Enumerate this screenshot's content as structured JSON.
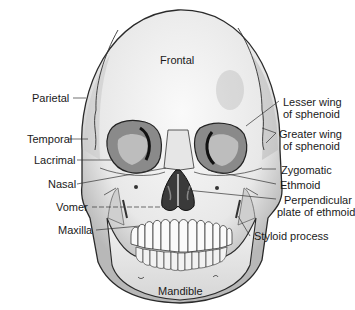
{
  "figure": {
    "labels_on_skull": {
      "frontal": "Frontal",
      "mandible": "Mandible"
    },
    "left_labels": [
      {
        "text": "Parietal"
      },
      {
        "text": "Temporal"
      },
      {
        "text": "Lacrimal"
      },
      {
        "text": "Nasal"
      },
      {
        "text": "Vomer"
      },
      {
        "text": "Maxilla"
      }
    ],
    "right_labels": [
      {
        "line1": "Lesser wing",
        "line2": "of sphenoid"
      },
      {
        "line1": "Greater wing",
        "line2": "of sphenoid"
      },
      {
        "line1": "Zygomatic"
      },
      {
        "line1": "Ethmoid"
      },
      {
        "line1": "Perpendicular",
        "line2": "plate of ethmoid"
      },
      {
        "line1": "Styloid process"
      }
    ],
    "colors": {
      "bone": "#ececec",
      "bone_shadow": "#9a9a9a",
      "outline": "#2a2a2a",
      "cavity": "#3a3a3a",
      "label": "#1a1a1a"
    }
  }
}
